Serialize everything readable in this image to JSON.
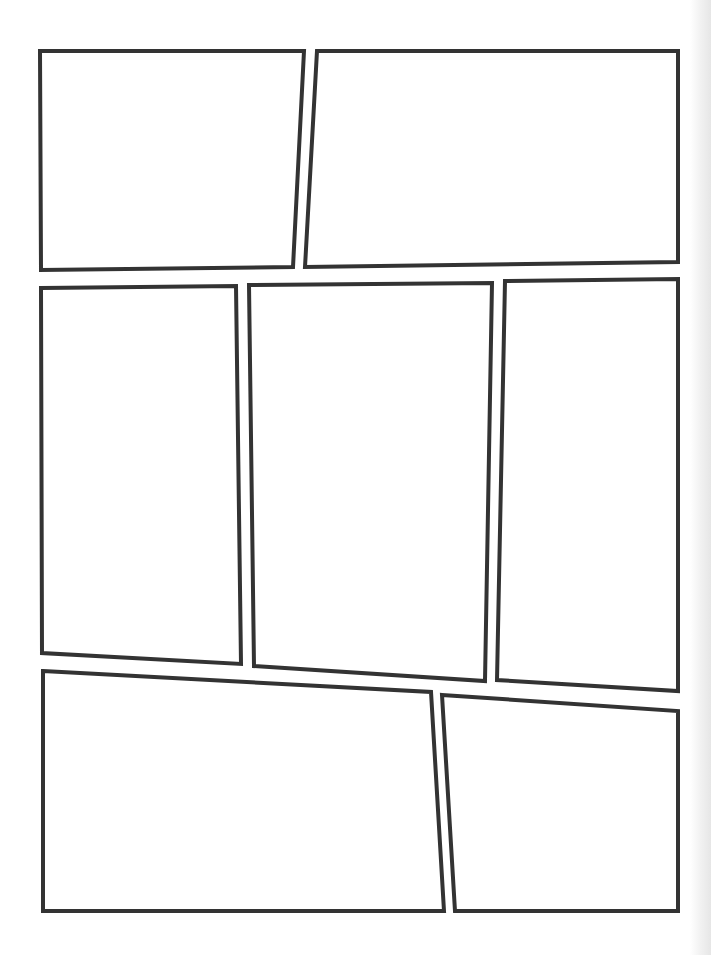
{
  "page": {
    "type": "comic-page-template",
    "width": 711,
    "height": 955,
    "background": "#ffffff",
    "stroke_color": "#333333",
    "stroke_width": 4
  },
  "panels": [
    {
      "id": "panel-1",
      "row": 1,
      "points": "40,51 304,51 293,267 41,270"
    },
    {
      "id": "panel-2",
      "row": 1,
      "points": "317,51 678,51 678,262 305,267"
    },
    {
      "id": "panel-3",
      "row": 2,
      "points": "41,288 236,286 241,664 42,653"
    },
    {
      "id": "panel-4",
      "row": 2,
      "points": "249,285 492,283 485,681 254,666"
    },
    {
      "id": "panel-5",
      "row": 2,
      "points": "505,281 678,279 678,691 497,680"
    },
    {
      "id": "panel-6",
      "row": 3,
      "points": "43,671 431,692 444,911 43,911"
    },
    {
      "id": "panel-7",
      "row": 3,
      "points": "442,695 678,711 678,911 455,911"
    }
  ]
}
